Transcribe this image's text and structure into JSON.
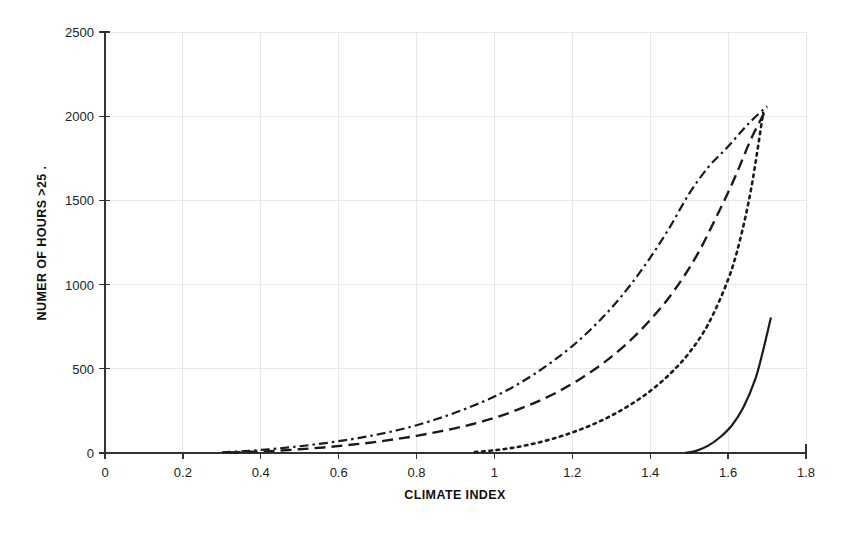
{
  "chart_data": {
    "type": "line",
    "title": "",
    "xlabel": "CLIMATE INDEX",
    "ylabel": "NUMER OF HOURS >25 .",
    "xlim": [
      0,
      1.8
    ],
    "ylim": [
      0,
      2500
    ],
    "xticks": [
      "0",
      "0.2",
      "0.4",
      "0.6",
      "0.8",
      "1",
      "1.2",
      "1.4",
      "1.6",
      "1.8"
    ],
    "xtick_values": [
      0,
      0.2,
      0.4,
      0.6,
      0.8,
      1.0,
      1.2,
      1.4,
      1.6,
      1.8
    ],
    "yticks": [
      "0",
      "500",
      "1000",
      "1500",
      "2000",
      "2500"
    ],
    "ytick_values": [
      0,
      500,
      1000,
      1500,
      2000,
      2500
    ],
    "grid": true,
    "legend": "none",
    "series": [
      {
        "name": "dash-dot-upper",
        "style": "dashdot",
        "x": [
          0.3,
          0.35,
          0.4,
          0.45,
          0.5,
          0.55,
          0.6,
          0.65,
          0.7,
          0.75,
          0.8,
          0.85,
          0.9,
          0.95,
          1.0,
          1.05,
          1.1,
          1.15,
          1.2,
          1.25,
          1.3,
          1.35,
          1.4,
          1.45,
          1.5,
          1.55,
          1.6,
          1.65,
          1.7
        ],
        "values": [
          4,
          10,
          18,
          28,
          40,
          54,
          70,
          88,
          110,
          135,
          165,
          200,
          240,
          285,
          335,
          395,
          465,
          545,
          635,
          740,
          860,
          1000,
          1160,
          1340,
          1540,
          1700,
          1820,
          1950,
          2060
        ]
      },
      {
        "name": "long-dash-middle",
        "style": "dashed",
        "x": [
          0.32,
          0.38,
          0.44,
          0.5,
          0.56,
          0.62,
          0.68,
          0.74,
          0.8,
          0.86,
          0.92,
          0.98,
          1.04,
          1.1,
          1.16,
          1.22,
          1.28,
          1.34,
          1.4,
          1.46,
          1.52,
          1.58,
          1.62,
          1.66,
          1.7
        ],
        "values": [
          3,
          7,
          13,
          22,
          33,
          46,
          61,
          80,
          102,
          128,
          158,
          195,
          240,
          295,
          360,
          440,
          535,
          650,
          790,
          960,
          1175,
          1450,
          1650,
          1870,
          2050
        ]
      },
      {
        "name": "dotted-lower",
        "style": "dotted",
        "x": [
          0.95,
          1.0,
          1.05,
          1.1,
          1.15,
          1.2,
          1.25,
          1.3,
          1.35,
          1.4,
          1.45,
          1.5,
          1.55,
          1.6,
          1.63,
          1.66,
          1.69
        ],
        "values": [
          6,
          16,
          32,
          55,
          85,
          122,
          167,
          222,
          288,
          368,
          468,
          595,
          770,
          1030,
          1260,
          1580,
          2020
        ]
      },
      {
        "name": "solid-lowest",
        "style": "solid",
        "x": [
          1.49,
          1.52,
          1.55,
          1.58,
          1.61,
          1.64,
          1.67,
          1.69,
          1.71
        ],
        "values": [
          0,
          14,
          45,
          95,
          165,
          275,
          440,
          610,
          805
        ]
      }
    ]
  },
  "axes": {
    "x_title": "CLIMATE INDEX",
    "y_title": "NUMER OF HOURS >25 ."
  }
}
